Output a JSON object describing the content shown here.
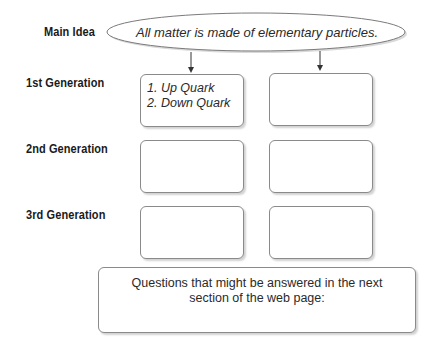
{
  "row_labels": {
    "main_idea": "Main Idea",
    "gen1": "1st Generation",
    "gen2": "2nd Generation",
    "gen3": "3rd Generation"
  },
  "main_idea_text": "All matter is made of elementary particles.",
  "boxes": {
    "gen1_left": [
      "1. Up Quark",
      "2. Down Quark"
    ],
    "gen1_right": [],
    "gen2_left": [],
    "gen2_right": [],
    "gen3_left": [],
    "gen3_right": []
  },
  "questions": {
    "line1": "Questions that might be answered in the next",
    "line2": "section of the web page:"
  }
}
